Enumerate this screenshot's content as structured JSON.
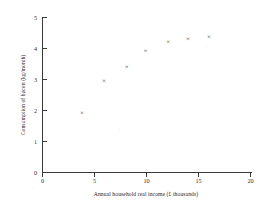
{
  "chart_data": {
    "type": "scatter",
    "title": "",
    "subtitle": "",
    "xlabel": "Annual household real income (£ thousands)",
    "ylabel": "Consumption of bacon (kg/month)",
    "xlim": [
      0,
      20
    ],
    "ylim": [
      0,
      5
    ],
    "xticks": [
      0,
      5,
      10,
      15,
      20
    ],
    "yticks": [
      0,
      1,
      2,
      3,
      4,
      5
    ],
    "xtick_labels": [
      "0",
      "5",
      "10",
      "15",
      "20"
    ],
    "ytick_labels": [
      "0",
      "1",
      "2",
      "3",
      "4",
      "5"
    ],
    "grid": false,
    "legend": null,
    "legend_position": "none",
    "marker": "x",
    "marker_color": "#2e2e2e",
    "axis_color": "#3a3a3a",
    "background_color": "#ffffff",
    "series": [
      {
        "name": "Bacon consumption vs income",
        "points": [
          {
            "x": 3.8,
            "y": 1.92
          },
          {
            "x": 5.9,
            "y": 2.93
          },
          {
            "x": 8.1,
            "y": 3.38
          },
          {
            "x": 9.9,
            "y": 3.9
          },
          {
            "x": 12.1,
            "y": 4.2
          },
          {
            "x": 14.0,
            "y": 4.28
          },
          {
            "x": 16.0,
            "y": 4.37
          }
        ]
      }
    ],
    "x": [
      3.8,
      5.9,
      8.1,
      9.9,
      12.1,
      14.0,
      16.0
    ],
    "values": [
      1.92,
      2.93,
      3.38,
      3.9,
      4.2,
      4.28,
      4.37
    ],
    "annotations": []
  },
  "figure": {
    "xlabel": "Annual household real income (£ thousands)",
    "ylabel": "Consumption of bacon (kg/month)"
  }
}
